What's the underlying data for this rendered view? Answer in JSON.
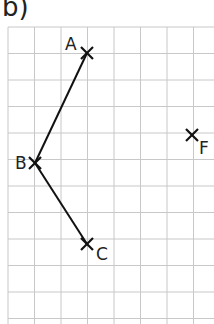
{
  "title": "b)",
  "grid": {
    "x0": 8,
    "y0": 27,
    "cell": 26.5,
    "cols": 8,
    "rows": 11,
    "color": "#c8c8c8"
  },
  "points": [
    {
      "label": "A",
      "x": 87,
      "y": 53
    },
    {
      "label": "B",
      "x": 35,
      "y": 163
    },
    {
      "label": "C",
      "x": 87,
      "y": 244
    },
    {
      "label": "F",
      "x": 192,
      "y": 135
    }
  ],
  "segments": [
    [
      "A",
      "B"
    ],
    [
      "B",
      "C"
    ]
  ]
}
